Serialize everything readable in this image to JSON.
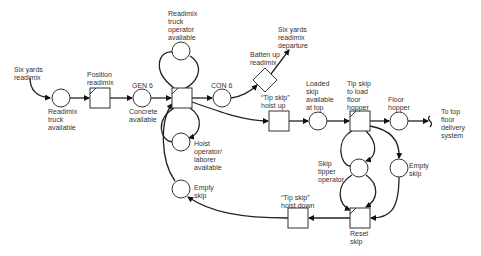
{
  "diagram": {
    "type": "CYCLONE process network",
    "labels": {
      "six_yards_readimix": "Six yards\nreadimix",
      "readimix_truck_available": "Readimix\ntruck\navailable",
      "position_readimix": "Position\nreadimix",
      "gen6": "GEN 6",
      "concrete_available": "Concrete\navailable",
      "readimix_operator_available": "Readimix\ntruck\noperator\navailable",
      "con6": "CON 6",
      "hoist_operator_available": "Hoist\noperator/\nlaborer\navailable",
      "empty_skip_left": "Empty\nskip",
      "batten_up_readimix": "Batten up\nreadimix",
      "six_yards_departure": "Six yards\nreadimix\ndeparture",
      "tip_skip_hoist_up": "“Tip skip”\nhoist up",
      "loaded_skip_available": "Loaded\nskip\navailable\nat top",
      "tip_skip_load_hopper": "Tip skip\nto load\nfloor\nhopper",
      "floor_hopper": "Floor\nhopper",
      "to_top_floor": "To top\nfloor\ndelivery\nsystem",
      "skip_tipper_operator": "Skip\ntipper\noperator",
      "empty_skip_right": "Empty\nskip",
      "tip_skip_hoist_down": "“Tip skip”\nhoist down",
      "reset_skip": "Reset\nskip"
    },
    "nodes": [
      {
        "id": "readimix_truck",
        "shape": "queue-circle"
      },
      {
        "id": "position_readimix",
        "shape": "combi-square"
      },
      {
        "id": "gen6",
        "shape": "queue-circle"
      },
      {
        "id": "main_combi",
        "shape": "combi-square"
      },
      {
        "id": "operator",
        "shape": "queue-circle"
      },
      {
        "id": "hoist_operator",
        "shape": "queue-circle"
      },
      {
        "id": "empty_skip_left",
        "shape": "queue-circle"
      },
      {
        "id": "con6",
        "shape": "queue-circle"
      },
      {
        "id": "batten_up",
        "shape": "diamond"
      },
      {
        "id": "hoist_up",
        "shape": "normal-square"
      },
      {
        "id": "loaded_skip",
        "shape": "queue-circle"
      },
      {
        "id": "tip_skip",
        "shape": "combi-square"
      },
      {
        "id": "floor_hopper",
        "shape": "queue-circle"
      },
      {
        "id": "skip_tipper",
        "shape": "queue-circle"
      },
      {
        "id": "empty_skip_right",
        "shape": "queue-circle"
      },
      {
        "id": "reset_skip",
        "shape": "combi-square"
      },
      {
        "id": "hoist_down",
        "shape": "normal-square"
      }
    ]
  }
}
